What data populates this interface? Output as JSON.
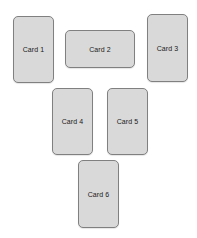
{
  "canvas": {
    "width": 197,
    "height": 238,
    "background": "#ffffff"
  },
  "style": {
    "card_fill": "#d9d9d9",
    "card_border": "#808080",
    "label_color": "#1a1a1a",
    "corner_radius": 5
  },
  "cards": [
    {
      "id": "card-1",
      "label": "Card 1",
      "x": 13,
      "y": 16,
      "width": 41,
      "height": 67,
      "orientation": "portrait"
    },
    {
      "id": "card-2",
      "label": "Card 2",
      "x": 65,
      "y": 30,
      "width": 70,
      "height": 38,
      "orientation": "landscape"
    },
    {
      "id": "card-3",
      "label": "Card 3",
      "x": 147,
      "y": 14,
      "width": 41,
      "height": 68,
      "orientation": "portrait"
    },
    {
      "id": "card-4",
      "label": "Card 4",
      "x": 52,
      "y": 88,
      "width": 41,
      "height": 67,
      "orientation": "portrait"
    },
    {
      "id": "card-5",
      "label": "Card 5",
      "x": 107,
      "y": 88,
      "width": 41,
      "height": 67,
      "orientation": "portrait"
    },
    {
      "id": "card-6",
      "label": "Card 6",
      "x": 78,
      "y": 160,
      "width": 41,
      "height": 68,
      "orientation": "portrait"
    }
  ]
}
